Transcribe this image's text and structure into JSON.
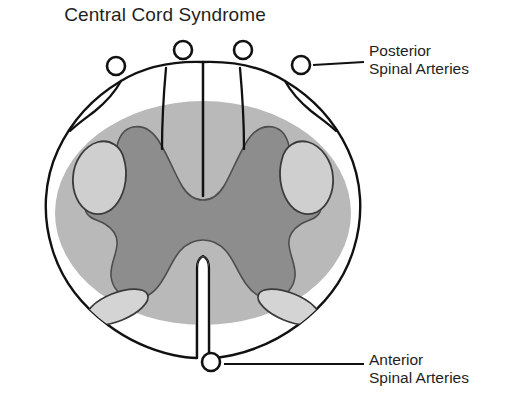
{
  "figure": {
    "title": "Central Cord Syndrome",
    "type": "anatomical-cross-section",
    "background_color": "#ffffff",
    "ink_color": "#111111"
  },
  "callouts": [
    {
      "id": "posterior-spinal-arteries",
      "line1": "Posterior",
      "line2": "Spinal Arteries",
      "leader_from_x": 302,
      "leader_from_y": 65,
      "leader_to_x": 364,
      "leader_to_y": 65
    },
    {
      "id": "anterior-spinal-arteries",
      "line1": "Anterior",
      "line2": "Spinal Arteries",
      "leader_from_x": 224,
      "leader_from_y": 362,
      "leader_to_x": 364,
      "leader_to_y": 362
    }
  ],
  "regions": {
    "cord_outline": {
      "label": "spinal cord white matter outline",
      "fill": "#ffffff",
      "stroke": "#111111"
    },
    "lesion_ellipse": {
      "label": "central cord lesion",
      "fill": "#b9b9b9",
      "cx": 203,
      "cy": 213,
      "rx": 148,
      "ry": 112
    },
    "gray_matter": {
      "label": "central gray matter butterfly",
      "fill": "#8d8d8d",
      "stroke": "#4a4a4a"
    },
    "lateral_tracts": {
      "label": "lateral corticospinal tracts",
      "fill": "#cfcfcf",
      "stroke": "#3b3b3b",
      "count": 2
    },
    "anterior_tracts": {
      "label": "anterior spinothalamic tracts",
      "fill": "#d4d4d4",
      "stroke": "#3b3b3b",
      "count": 2
    },
    "posterior_sulci": {
      "label": "posterior sulci and median septum",
      "count": 5
    },
    "anterior_median_fissure": {
      "label": "anterior median fissure",
      "fill": "#ffffff"
    }
  },
  "arteries": {
    "posterior": {
      "label": "Posterior Spinal Arteries",
      "marker": "open-circle",
      "radius": 9,
      "stroke": "#111111",
      "fill": "#ffffff",
      "positions": [
        {
          "cx": 116,
          "cy": 66
        },
        {
          "cx": 183,
          "cy": 50
        },
        {
          "cx": 243,
          "cy": 50
        },
        {
          "cx": 301,
          "cy": 65
        }
      ]
    },
    "anterior": {
      "label": "Anterior Spinal Arteries",
      "marker": "open-circle",
      "radius": 9,
      "stroke": "#111111",
      "fill": "#ffffff",
      "positions": [
        {
          "cx": 211,
          "cy": 362
        }
      ]
    }
  }
}
